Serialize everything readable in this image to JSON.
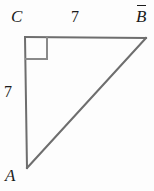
{
  "figure": {
    "kind": "right-triangle",
    "background_color": "#fdfdfd",
    "stroke_color": "#6e6e6e",
    "text_color": "#1b1b1b",
    "stroke_width": 2,
    "vertices": {
      "C": {
        "label": "C",
        "x": 25,
        "y": 37
      },
      "B": {
        "label": "B",
        "x": 146,
        "y": 38
      },
      "A": {
        "label": "A",
        "x": 27,
        "y": 168
      }
    },
    "right_angle": {
      "at_vertex": "C",
      "marker": "square",
      "size": 22
    },
    "side_labels": {
      "top": "7",
      "left": "7"
    },
    "segments": [
      {
        "name": "CB",
        "from": "C",
        "to": "B",
        "length_label": "7"
      },
      {
        "name": "CA",
        "from": "C",
        "to": "A",
        "length_label": "7"
      },
      {
        "name": "AB",
        "from": "A",
        "to": "B",
        "length_label": ""
      }
    ]
  }
}
